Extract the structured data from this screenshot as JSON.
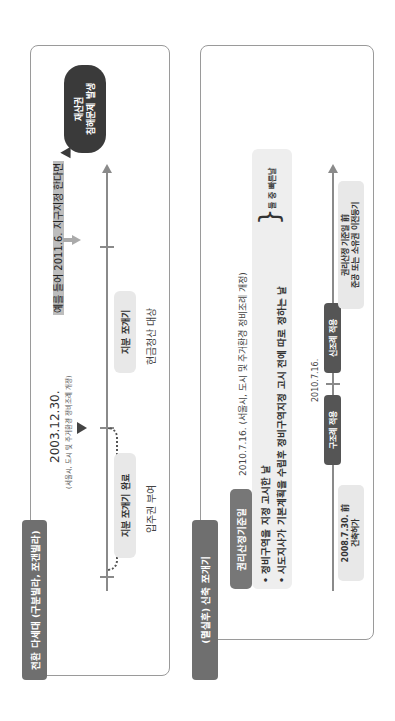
{
  "panel1": {
    "tag": "전환 다세대 (구분빌라, 쪼갠빌라)",
    "date_main": "2003.12.30.",
    "date_note": "(서울시, 도시 및 주거환경 정비조례 개정)",
    "left_pill": "지분 쪼개기 완료",
    "left_sub": "입주권 부여",
    "right_pill": "지분 쪼개기",
    "right_sub": "현금청산 대상",
    "example_note": "예를 들어 2011.6. 지구지정 한다면",
    "bubble_line1": "재산권",
    "bubble_line2": "침해문제 발생",
    "colors": {
      "tag": "#6f6f6f",
      "bubble": "#3a3a3a",
      "pill": "#e8e8e8",
      "line": "#8a8a8a"
    }
  },
  "panel2": {
    "tag": "(멸실후) 신축 쪼개기",
    "rights_tag": "권리산정기준일",
    "date_note": "2010.7.16. (서울시, 도시 및 주거환경 정비조례 개정)",
    "bullet1": "• 정비구역을 지정 고시한 날",
    "bullet2": "• 시도지사가 기본계획을 수립후 정비구역지정 고시 전에 따로 정하는 날",
    "brace": "}",
    "brace_note": "둘 중 빠른날",
    "left_box_line1": "2008.7.30. 前",
    "left_box_line2": "건축허가",
    "old_rule": "구조례 적용",
    "timeline_date": "2010.7.16.",
    "new_rule": "신조례 적용",
    "right_box_line1": "권리산정 기준일 前",
    "right_box_line2": "준공 또는 소유권 이전등기",
    "colors": {
      "tag": "#6f6f6f",
      "rights_tag": "#777777",
      "rule_pill": "#555555",
      "box": "#e8e8e8"
    }
  }
}
